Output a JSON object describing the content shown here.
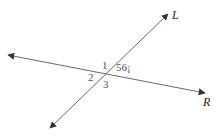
{
  "diagram": {
    "type": "intersecting-lines",
    "lines": [
      {
        "name": "L",
        "label": "L",
        "from": [
          50,
          128
        ],
        "to": [
          168,
          14
        ]
      },
      {
        "name": "R",
        "label": "R",
        "from": [
          8,
          55
        ],
        "to": [
          205,
          93
        ]
      }
    ],
    "intersection": [
      107,
      74
    ],
    "angle_labels": [
      {
        "id": "1",
        "text": "1"
      },
      {
        "id": "2",
        "text": "2"
      },
      {
        "id": "3",
        "text": "3"
      },
      {
        "id": "given",
        "text": "56¡"
      }
    ],
    "colors": {
      "line": "#6a6a6a",
      "label": "#555555",
      "line_label": "#222222",
      "background": "#ffffff"
    }
  }
}
